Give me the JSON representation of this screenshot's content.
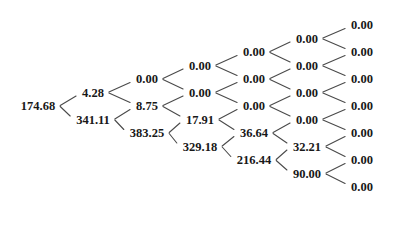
{
  "figure": {
    "type": "binomial-lattice",
    "title": "",
    "background_color": "#ffffff",
    "text_color": "#181818",
    "line_color": "#4a4a4a",
    "steps": 6,
    "columns": 7
  },
  "chart_data": {
    "type": "tree",
    "title": "",
    "xlabel": "",
    "ylabel": "",
    "orientation": "left-to-right",
    "node_format": "0.00",
    "columns": [
      {
        "step": 0,
        "x": 38,
        "values": [
          "174.68"
        ]
      },
      {
        "step": 1,
        "x": 93,
        "values": [
          "4.28",
          "341.11"
        ]
      },
      {
        "step": 2,
        "x": 147,
        "values": [
          "0.00",
          "8.75",
          "383.25"
        ]
      },
      {
        "step": 3,
        "x": 200,
        "values": [
          "0.00",
          "0.00",
          "17.91",
          "329.18"
        ]
      },
      {
        "step": 4,
        "x": 254,
        "values": [
          "0.00",
          "0.00",
          "0.00",
          "36.64",
          "216.44"
        ]
      },
      {
        "step": 5,
        "x": 307,
        "values": [
          "0.00",
          "0.00",
          "0.00",
          "0.00",
          "32.21",
          "90.00"
        ]
      },
      {
        "step": 6,
        "x": 362,
        "values": [
          "0.00",
          "0.00",
          "0.00",
          "0.00",
          "0.00",
          "0.00",
          "0.00"
        ]
      }
    ],
    "all_values_flat": [
      "174.68",
      "4.28",
      "341.11",
      "0.00",
      "8.75",
      "383.25",
      "0.00",
      "0.00",
      "17.91",
      "329.18",
      "0.00",
      "0.00",
      "0.00",
      "36.64",
      "216.44",
      "0.00",
      "0.00",
      "0.00",
      "0.00",
      "32.21",
      "90.00",
      "0.00",
      "0.00",
      "0.00",
      "0.00",
      "0.00",
      "0.00",
      "0.00"
    ],
    "layout": {
      "row_spacing": 27,
      "col_spacing": 54,
      "center_y": 106,
      "node_font_size": 12.5
    }
  }
}
